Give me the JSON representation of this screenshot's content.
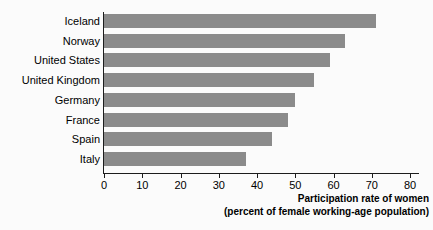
{
  "chart_data": {
    "type": "bar",
    "orientation": "horizontal",
    "title": "",
    "subtitle": "",
    "xlabel": "Participation rate of women",
    "xlabel_line2": "(percent of female working-age population)",
    "ylabel": "",
    "categories": [
      "Iceland",
      "Norway",
      "United States",
      "United Kingdom",
      "Germany",
      "France",
      "Spain",
      "Italy"
    ],
    "values": [
      71,
      63,
      59,
      55,
      50,
      48,
      44,
      37
    ],
    "xlim": [
      0,
      80
    ],
    "xticks": [
      0,
      10,
      20,
      30,
      40,
      50,
      60,
      70,
      80
    ],
    "xtick_labels": [
      "0",
      "10",
      "20",
      "30",
      "40",
      "50",
      "60",
      "70",
      "80"
    ],
    "grid": false,
    "legend": false,
    "series": [
      {
        "name": "Participation rate of women",
        "values": [
          71,
          63,
          59,
          55,
          50,
          48,
          44,
          37
        ]
      }
    ]
  },
  "colors": {
    "bar": "#8b8b8b",
    "axis": "#1c1c1c",
    "text": "#000000",
    "background": "#fbfbfb"
  }
}
